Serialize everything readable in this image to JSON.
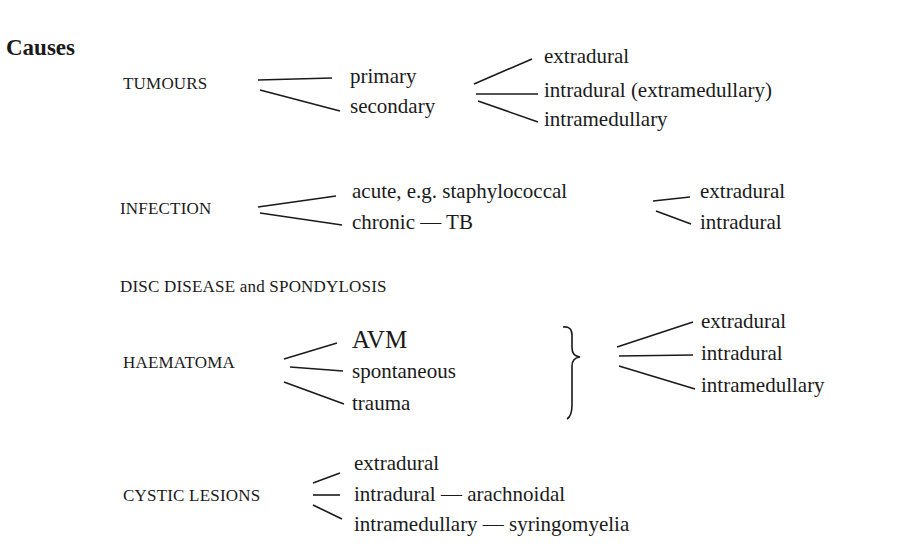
{
  "heading": "Causes",
  "groups": {
    "tumours": {
      "label": "TUMOURS",
      "types": [
        "primary",
        "secondary"
      ],
      "sites": [
        "extradural",
        "intradural (extramedullary)",
        "intramedullary"
      ]
    },
    "infection": {
      "label": "INFECTION",
      "types": [
        "acute, e.g. staphylococcal",
        "chronic — TB"
      ],
      "sites": [
        "extradural",
        "intradural"
      ]
    },
    "disc": {
      "label": "DISC DISEASE and SPONDYLOSIS"
    },
    "haematoma": {
      "label": "HAEMATOMA",
      "types": [
        "AVM",
        "spontaneous",
        "trauma"
      ],
      "sites": [
        "extradural",
        "intradural",
        "intramedullary"
      ]
    },
    "cystic": {
      "label": "CYSTIC LESIONS",
      "types": [
        "extradural",
        "intradural — arachnoidal",
        "intramedullary — syringomyelia"
      ]
    }
  }
}
